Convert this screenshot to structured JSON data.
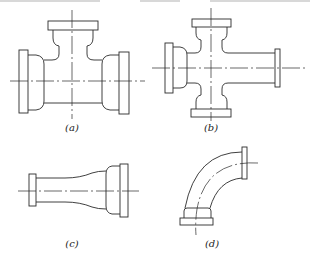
{
  "figure": {
    "panels": [
      {
        "id": "a",
        "label": "(a)",
        "shape": "tee"
      },
      {
        "id": "b",
        "label": "(b)",
        "shape": "cross with reduced branch"
      },
      {
        "id": "c",
        "label": "(c)",
        "shape": "reducer"
      },
      {
        "id": "d",
        "label": "(d)",
        "shape": "90-degree bend"
      }
    ]
  },
  "colors": {
    "line": "#2a2a2a",
    "background": "#ffffff"
  }
}
